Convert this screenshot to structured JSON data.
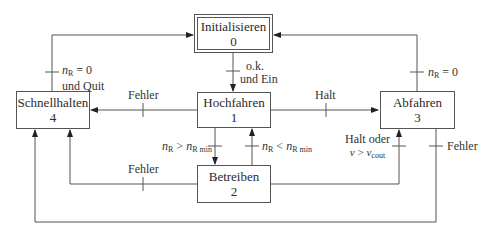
{
  "states": [
    {
      "id": "init",
      "name": "Initialisieren",
      "number": "0"
    },
    {
      "id": "hoch",
      "name": "Hochfahren",
      "number": "1"
    },
    {
      "id": "betr",
      "name": "Betreiben",
      "number": "2"
    },
    {
      "id": "abf",
      "name": "Abfahren",
      "number": "3"
    },
    {
      "id": "schnell",
      "name": "Schnellhalten",
      "number": "4"
    }
  ],
  "transitions": {
    "init_to_hoch": {
      "line1": "o.k.",
      "line2": "und Ein"
    },
    "schnell_to_init": {
      "var": "n",
      "sub": "R",
      "rel": " = 0",
      "line2": "und Quit"
    },
    "abf_to_init": {
      "var": "n",
      "sub": "R",
      "rel": " = 0"
    },
    "hoch_to_schnell": {
      "label": "Fehler"
    },
    "hoch_to_abf": {
      "label": "Halt"
    },
    "hoch_to_betr": {
      "var": "n",
      "sub": "R",
      "rel": " > ",
      "var2": "n",
      "sub2": "R min"
    },
    "betr_to_hoch": {
      "var": "n",
      "sub": "R",
      "rel": " < ",
      "var2": "n",
      "sub2": "R min"
    },
    "betr_to_schnell": {
      "label": "Fehler"
    },
    "betr_to_abf": {
      "line1": "Halt oder",
      "var": "v",
      "rel": " > ",
      "var2": "v",
      "sub2": "cout"
    },
    "abf_to_schnell": {
      "label": "Fehler"
    }
  }
}
